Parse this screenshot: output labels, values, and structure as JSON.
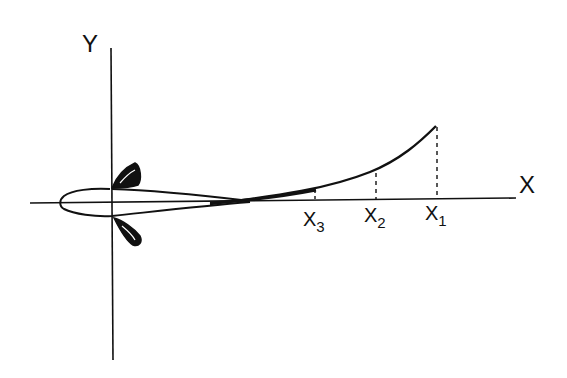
{
  "diagram": {
    "axes": {
      "x_label": "X",
      "y_label": "Y"
    },
    "markers": [
      {
        "id": "x1",
        "base": "X",
        "sub": "1"
      },
      {
        "id": "x2",
        "base": "X",
        "sub": "2"
      },
      {
        "id": "x3",
        "base": "X",
        "sub": "3"
      }
    ],
    "colors": {
      "ink": "#111111",
      "background": "#ffffff"
    }
  }
}
